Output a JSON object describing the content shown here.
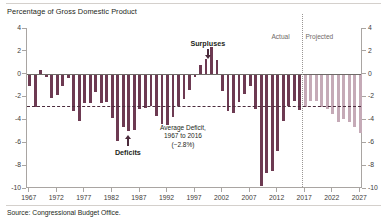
{
  "chart_title": "Percentage of Gross Domestic Product",
  "source_note": "Source: Congressional Budget Office.",
  "annotations": {
    "surpluses": "Surpluses",
    "deficits": "Deficits",
    "actual": "Actual",
    "projected": "Projected",
    "average_line1": "Average Deficit,",
    "average_line2": "1967 to 2016",
    "average_line3": "(−2.8%)"
  },
  "colors": {
    "actual_bar": "#6d3a52",
    "projected_bar": "#c5aab7",
    "average_line": "#4b2b3c",
    "axis": "#a9a5a2",
    "zero_line": "#6f6b68",
    "divider": "#9a9694",
    "text": "#231f20"
  },
  "chart_data": {
    "type": "bar",
    "title": "Percentage of Gross Domestic Product",
    "xlabel": "",
    "ylabel": "",
    "ylim": [
      -10,
      4
    ],
    "ytick_labels": [
      "4",
      "2",
      "0",
      "-2",
      "-4",
      "-6",
      "-8",
      "-10"
    ],
    "ytick_values": [
      4,
      2,
      0,
      -2,
      -4,
      -6,
      -8,
      -10
    ],
    "xtick_labels": [
      "1967",
      "1972",
      "1977",
      "1982",
      "1987",
      "1992",
      "1997",
      "2002",
      "2007",
      "2012",
      "2017",
      "2022",
      "2027"
    ],
    "xtick_values": [
      1967,
      1972,
      1977,
      1982,
      1987,
      1992,
      1997,
      2002,
      2007,
      2012,
      2017,
      2022,
      2027
    ],
    "grid": false,
    "legend_position": "none",
    "average_deficit_value": -2.8,
    "average_deficit_period": "1967 to 2016",
    "actual_projected_split_year": 2016.5,
    "categories": [
      1967,
      1968,
      1969,
      1970,
      1971,
      1972,
      1973,
      1974,
      1975,
      1976,
      1977,
      1978,
      1979,
      1980,
      1981,
      1982,
      1983,
      1984,
      1985,
      1986,
      1987,
      1988,
      1989,
      1990,
      1991,
      1992,
      1993,
      1994,
      1995,
      1996,
      1997,
      1998,
      1999,
      2000,
      2001,
      2002,
      2003,
      2004,
      2005,
      2006,
      2007,
      2008,
      2009,
      2010,
      2011,
      2012,
      2013,
      2014,
      2015,
      2016,
      2017,
      2018,
      2019,
      2020,
      2021,
      2022,
      2023,
      2024,
      2025,
      2026,
      2027
    ],
    "series": [
      {
        "name": "Actual",
        "values": [
          -1.1,
          -2.9,
          0.3,
          -0.3,
          -2.1,
          -1.9,
          -1.1,
          -0.4,
          -3.3,
          -4.1,
          -2.6,
          -2.6,
          -1.6,
          -2.6,
          -2.5,
          -3.9,
          -5.9,
          -4.7,
          -5.0,
          -4.9,
          -3.1,
          -3.0,
          -2.8,
          -3.7,
          -4.4,
          -4.5,
          -3.8,
          -2.8,
          -2.2,
          -1.4,
          -0.3,
          0.8,
          1.3,
          2.3,
          1.2,
          -1.5,
          -3.3,
          -3.4,
          -2.5,
          -1.8,
          -1.1,
          -3.1,
          -9.8,
          -8.7,
          -8.5,
          -6.8,
          -4.1,
          -2.8,
          -2.4,
          -3.2,
          null,
          null,
          null,
          null,
          null,
          null,
          null,
          null,
          null,
          null,
          null
        ]
      },
      {
        "name": "Projected",
        "values": [
          null,
          null,
          null,
          null,
          null,
          null,
          null,
          null,
          null,
          null,
          null,
          null,
          null,
          null,
          null,
          null,
          null,
          null,
          null,
          null,
          null,
          null,
          null,
          null,
          null,
          null,
          null,
          null,
          null,
          null,
          null,
          null,
          null,
          null,
          null,
          null,
          null,
          null,
          null,
          null,
          null,
          null,
          null,
          null,
          null,
          null,
          null,
          null,
          null,
          null,
          -2.9,
          -2.4,
          -2.4,
          -2.9,
          -3.1,
          -3.5,
          -4.2,
          -4.0,
          -4.2,
          -4.7,
          -5.2
        ]
      }
    ]
  }
}
